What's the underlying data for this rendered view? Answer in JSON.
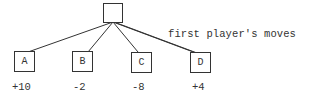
{
  "diagram": {
    "type": "game-tree",
    "root": {
      "label": ""
    },
    "annotation": "first player's moves",
    "children": [
      {
        "label": "A",
        "value": "+10"
      },
      {
        "label": "B",
        "value": "-2"
      },
      {
        "label": "C",
        "value": "-8"
      },
      {
        "label": "D",
        "value": "+4"
      }
    ],
    "colors": {
      "line": "#333333",
      "text": "#333333",
      "background": "#ffffff"
    }
  }
}
